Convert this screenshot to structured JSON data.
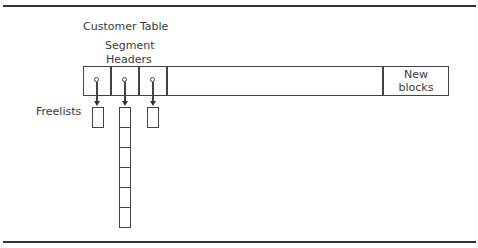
{
  "diagram": {
    "title": "Customer Table",
    "segment_headers_label_line1": "Segment",
    "segment_headers_label_line2": "Headers",
    "new_blocks_line1": "New",
    "new_blocks_line2": "blocks",
    "freelists_label": "Freelists",
    "segment_header_count": 3,
    "freelists": [
      {
        "header_index": 0,
        "block_count": 1
      },
      {
        "header_index": 1,
        "block_count": 6
      },
      {
        "header_index": 2,
        "block_count": 1
      }
    ],
    "colors": {
      "line": "#444444",
      "text": "#3a3a3a",
      "background": "#ffffff"
    }
  }
}
